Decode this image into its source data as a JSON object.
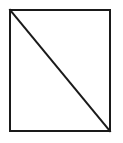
{
  "canvas": {
    "width": 123,
    "height": 143,
    "background_color": "#ffffff"
  },
  "figure": {
    "name": "rectangle-with-diagonal",
    "stroke_color": "#1a1a1a",
    "fill_color": "#ffffff",
    "stroke_width": 2,
    "rectangle": {
      "x": 10,
      "y": 10,
      "width": 100,
      "height": 121
    },
    "diagonal": {
      "x1": 10,
      "y1": 10,
      "x2": 110,
      "y2": 131
    }
  }
}
